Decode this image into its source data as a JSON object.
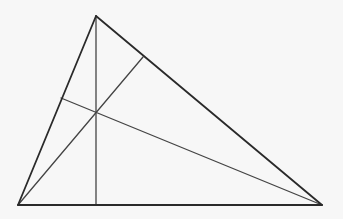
{
  "diagram": {
    "type": "triangle-with-altitudes",
    "width": 343,
    "height": 219,
    "background": "#f7f7f7",
    "stroke_color": "#2a2a2a",
    "inner_stroke_color": "#444444",
    "vertices": {
      "A": [
        96,
        16
      ],
      "B": [
        18,
        205
      ],
      "C": [
        322,
        205
      ]
    },
    "feet": {
      "on_BC": [
        96,
        205
      ],
      "on_AC": [
        143,
        57
      ],
      "on_AB": [
        61,
        98
      ]
    },
    "concurrency_point": [
      96,
      113
    ],
    "edges": [
      {
        "name": "side-AB",
        "from": [
          96,
          16
        ],
        "to": [
          18,
          205
        ]
      },
      {
        "name": "side-AC",
        "from": [
          96,
          16
        ],
        "to": [
          322,
          205
        ]
      },
      {
        "name": "side-BC",
        "from": [
          18,
          205
        ],
        "to": [
          322,
          205
        ]
      }
    ],
    "cevians": [
      {
        "name": "altitude-from-A",
        "from": [
          96,
          16
        ],
        "to": [
          96,
          205
        ]
      },
      {
        "name": "altitude-from-B",
        "from": [
          18,
          205
        ],
        "to": [
          143,
          57
        ]
      },
      {
        "name": "altitude-from-C",
        "from": [
          322,
          205
        ],
        "to": [
          61,
          98
        ]
      }
    ]
  }
}
